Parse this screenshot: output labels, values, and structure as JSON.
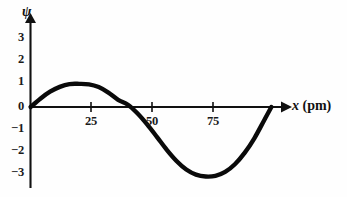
{
  "chart_data": {
    "type": "line",
    "title": "",
    "subtitle": "",
    "xlabel_variable": "x",
    "xlabel_unit": "(pm)",
    "xlabel": "x (pm)",
    "ylabel": "ψ",
    "xlim": [
      0,
      105
    ],
    "ylim": [
      -3.6,
      3.6
    ],
    "grid": false,
    "legend": null,
    "xticks": [
      25,
      50,
      75
    ],
    "xtick_labels": [
      "25",
      "50",
      "75"
    ],
    "yticks": [
      3,
      2,
      1,
      0,
      -1,
      -2,
      -3
    ],
    "ytick_labels": [
      "3",
      "2",
      "1",
      "0",
      "−1",
      "−2",
      "−3"
    ],
    "curve_color": "#0a0a0a",
    "axis_color": "#111111",
    "annotations": [],
    "series": [
      {
        "name": "psi",
        "x": [
          0,
          4,
          8,
          12,
          16,
          20,
          24,
          28,
          32,
          36,
          40,
          44,
          48,
          52,
          56,
          60,
          64,
          68,
          72,
          76,
          80,
          84,
          88,
          92,
          96,
          99
        ],
        "y": [
          0.0,
          0.36,
          0.66,
          0.87,
          0.99,
          1.0,
          0.98,
          0.86,
          0.62,
          0.31,
          0.1,
          -0.28,
          -0.76,
          -1.3,
          -1.85,
          -2.33,
          -2.7,
          -2.92,
          -3.0,
          -2.97,
          -2.8,
          -2.47,
          -1.98,
          -1.35,
          -0.58,
          0.0
        ]
      }
    ],
    "key_points": {
      "origin": {
        "x": 0,
        "y": 0
      },
      "peak": {
        "x": 24,
        "y": 1
      },
      "zero_crossing": {
        "x": 42,
        "y": 0
      },
      "trough": {
        "x": 75,
        "y": -3
      },
      "right_end": {
        "x": 99,
        "y": 0
      }
    }
  },
  "axes": {
    "y_title": "ψ",
    "x_title_variable": "x",
    "x_title_unit": "(pm)"
  },
  "ticks": {
    "x": [
      {
        "label": "25",
        "left": 90
      },
      {
        "label": "50",
        "left": 151
      },
      {
        "label": "75",
        "left": 212
      }
    ],
    "y": [
      {
        "label": "3",
        "top": 37
      },
      {
        "label": "2",
        "top": 59
      },
      {
        "label": "1",
        "top": 81
      },
      {
        "label": "0",
        "top": 103
      },
      {
        "label": "−1",
        "top": 125
      },
      {
        "label": "−2",
        "top": 147
      },
      {
        "label": "−3",
        "top": 169
      }
    ]
  }
}
